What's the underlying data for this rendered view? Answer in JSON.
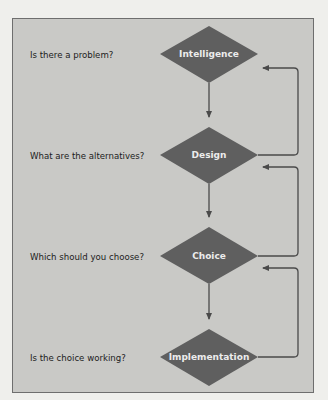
{
  "diagram": {
    "type": "decision-making-process-flowchart",
    "colors": {
      "background": "#efefec",
      "panel": "#c9c9c6",
      "diamond_fill": "#5f5f5f",
      "diamond_text": "#ececec",
      "line": "#4a4a4a",
      "question_text": "#1c1c1c"
    },
    "stages": [
      {
        "name": "Intelligence",
        "question": "Is there a problem?"
      },
      {
        "name": "Design",
        "question": "What are the alternatives?"
      },
      {
        "name": "Choice",
        "question": "Which should you choose?"
      },
      {
        "name": "Implementation",
        "question": "Is the choice working?"
      }
    ],
    "edges": [
      {
        "from": "Intelligence",
        "to": "Design",
        "kind": "forward"
      },
      {
        "from": "Design",
        "to": "Choice",
        "kind": "forward"
      },
      {
        "from": "Choice",
        "to": "Implementation",
        "kind": "forward"
      },
      {
        "from": "Design",
        "to": "Intelligence",
        "kind": "feedback"
      },
      {
        "from": "Choice",
        "to": "Design",
        "kind": "feedback"
      },
      {
        "from": "Implementation",
        "to": "Choice",
        "kind": "feedback"
      }
    ]
  }
}
